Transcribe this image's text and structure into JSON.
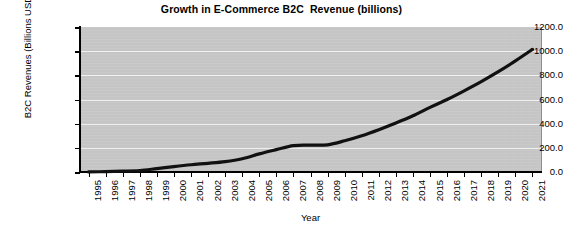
{
  "chart_data": {
    "type": "line",
    "title": "Growth in E-Commerce B2C  Revenue (billions)",
    "xlabel": "Year",
    "ylabel": "B2C Revenues (Billions USD)",
    "categories": [
      "1995",
      "1996",
      "1997",
      "1998",
      "1999",
      "2000",
      "2001",
      "2002",
      "2003",
      "2004",
      "2005",
      "2006",
      "2007",
      "2008",
      "2009",
      "2010",
      "2011",
      "2012",
      "2013",
      "2014",
      "2015",
      "2016",
      "2017",
      "2018",
      "2019",
      "2020",
      "2021"
    ],
    "values": [
      1,
      3,
      7,
      12,
      28,
      45,
      60,
      72,
      86,
      110,
      150,
      185,
      218,
      222,
      225,
      258,
      300,
      350,
      405,
      465,
      535,
      600,
      672,
      748,
      830,
      920,
      1015
    ],
    "series": [
      {
        "name": "B2C Revenues",
        "values": [
          1,
          3,
          7,
          12,
          28,
          45,
          60,
          72,
          86,
          110,
          150,
          185,
          218,
          222,
          225,
          258,
          300,
          350,
          405,
          465,
          535,
          600,
          672,
          748,
          830,
          920,
          1015
        ],
        "color": "#111111"
      }
    ],
    "ylim": [
      0,
      1200
    ],
    "ytick_labels": [
      "0.0",
      "200.0",
      "400.0",
      "600.0",
      "800.0",
      "1000.0",
      "1200.0"
    ],
    "ytick_values": [
      0,
      200,
      400,
      600,
      800,
      1000,
      1200
    ],
    "grid": true,
    "legend": "none",
    "plot_background_color": "#c8c8c8",
    "gridline_color": "#f2f2f2",
    "axis_color": "#000000",
    "line_color": "#111111"
  }
}
